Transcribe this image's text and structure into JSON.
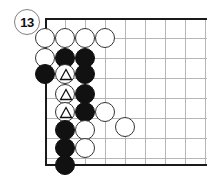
{
  "figure": {
    "move_marker": {
      "label": "13",
      "icon": "circled-move-number",
      "x": 27,
      "y": 22
    }
  },
  "board": {
    "origin_x": 45,
    "origin_y": 18,
    "cell": 20,
    "cols": 9,
    "rows": 8,
    "edge_color": "#1a1a1a",
    "grid_color": "#b6b6b6",
    "edges": [
      "top",
      "left",
      "bottom"
    ],
    "grid_lines_v": [
      65,
      85,
      105,
      125,
      145,
      165,
      185,
      205
    ],
    "grid_lines_h": [
      38,
      58,
      78,
      98,
      118,
      138,
      158
    ]
  },
  "stones": [
    {
      "color": "white",
      "x": 45,
      "y": 38,
      "mark": "none"
    },
    {
      "color": "white",
      "x": 65,
      "y": 38,
      "mark": "none"
    },
    {
      "color": "white",
      "x": 85,
      "y": 38,
      "mark": "none"
    },
    {
      "color": "white",
      "x": 105,
      "y": 38,
      "mark": "none"
    },
    {
      "color": "white",
      "x": 45,
      "y": 58,
      "mark": "none"
    },
    {
      "color": "black",
      "x": 65,
      "y": 58,
      "mark": "none"
    },
    {
      "color": "black",
      "x": 85,
      "y": 58,
      "mark": "none"
    },
    {
      "color": "black",
      "x": 45,
      "y": 74,
      "mark": "none"
    },
    {
      "color": "white",
      "x": 65,
      "y": 74,
      "mark": "triangle"
    },
    {
      "color": "black",
      "x": 85,
      "y": 74,
      "mark": "none"
    },
    {
      "color": "white",
      "x": 65,
      "y": 94,
      "mark": "triangle"
    },
    {
      "color": "black",
      "x": 85,
      "y": 94,
      "mark": "none"
    },
    {
      "color": "white",
      "x": 65,
      "y": 112,
      "mark": "triangle"
    },
    {
      "color": "black",
      "x": 85,
      "y": 112,
      "mark": "none"
    },
    {
      "color": "white",
      "x": 105,
      "y": 112,
      "mark": "none"
    },
    {
      "color": "black",
      "x": 65,
      "y": 130,
      "mark": "none"
    },
    {
      "color": "white",
      "x": 85,
      "y": 130,
      "mark": "none"
    },
    {
      "color": "white",
      "x": 125,
      "y": 127,
      "mark": "none"
    },
    {
      "color": "black",
      "x": 65,
      "y": 148,
      "mark": "none"
    },
    {
      "color": "white",
      "x": 85,
      "y": 148,
      "mark": "none"
    },
    {
      "color": "black",
      "x": 65,
      "y": 165,
      "mark": "none"
    }
  ]
}
